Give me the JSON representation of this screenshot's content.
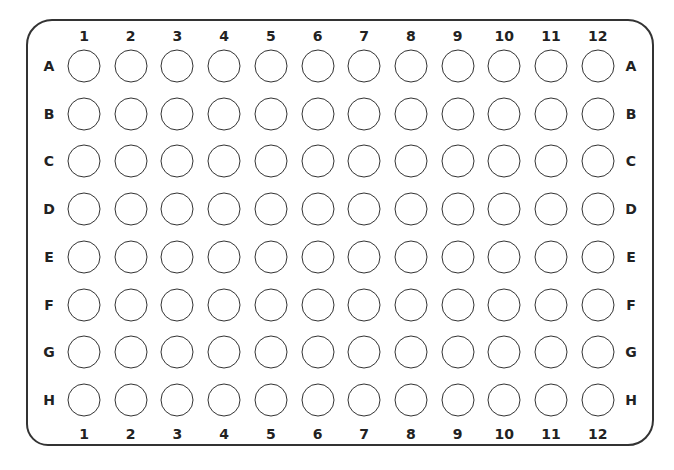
{
  "plate": {
    "columns": [
      "1",
      "2",
      "3",
      "4",
      "5",
      "6",
      "7",
      "8",
      "9",
      "10",
      "11",
      "12"
    ],
    "rows": [
      "A",
      "B",
      "C",
      "D",
      "E",
      "F",
      "G",
      "H"
    ],
    "well_count": 96,
    "colors": {
      "outline": "#333333",
      "label": "#222222",
      "well_fill": "#ffffff"
    }
  }
}
